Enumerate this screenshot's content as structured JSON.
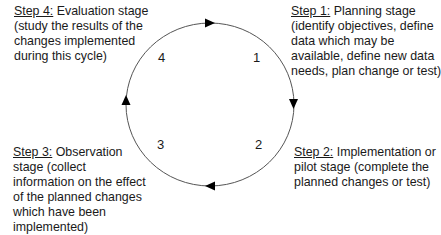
{
  "diagram": {
    "type": "cycle",
    "direction": "clockwise",
    "colors": {
      "line": "#555555",
      "arrow": "#000000",
      "text": "#1a1a1a"
    },
    "stages": [
      {
        "number": "1",
        "heading": "Step 1:",
        "lines": [
          " Planning stage",
          "(identify objectives, define",
          "data which may be",
          "available, define new data",
          "needs, plan change or test)"
        ]
      },
      {
        "number": "2",
        "heading": "Step 2:",
        "lines": [
          " Implementation or",
          "pilot stage (complete the",
          "planned changes or test)"
        ]
      },
      {
        "number": "3",
        "heading": "Step 3:",
        "lines": [
          " Observation",
          "stage (collect",
          "information on the effect",
          "of the planned changes",
          "which have been",
          "implemented)"
        ]
      },
      {
        "number": "4",
        "heading": "Step 4:",
        "lines": [
          " Evaluation stage",
          "(study the results of the",
          "changes implemented",
          "during this cycle)"
        ]
      }
    ]
  }
}
